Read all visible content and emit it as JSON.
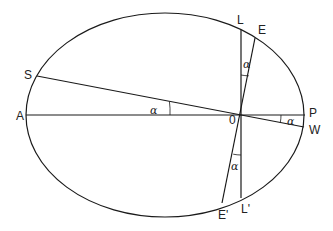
{
  "diagram": {
    "type": "ellipse-orbit-geometry",
    "ellipse": {
      "cx": 165,
      "cy": 115,
      "rx": 139,
      "ry": 102
    },
    "focus": {
      "label": "0",
      "x": 241,
      "y": 115
    },
    "points": {
      "A": {
        "label": "A",
        "x": 26,
        "y": 115
      },
      "P": {
        "label": "P",
        "x": 305,
        "y": 115
      },
      "L": {
        "label": "L",
        "x": 241,
        "y": 30
      },
      "L_prime": {
        "label": "L'",
        "x": 241,
        "y": 198
      },
      "E": {
        "label": "E",
        "x": 255,
        "y": 38
      },
      "E_prime": {
        "label": "E'",
        "x": 222,
        "y": 203
      },
      "S": {
        "label": "S",
        "x": 37,
        "y": 76
      },
      "W": {
        "label": "W",
        "x": 304,
        "y": 127
      }
    },
    "segments": [
      {
        "from": "A",
        "to": "P",
        "name": "major-axis"
      },
      {
        "from": "L",
        "to": "L_prime",
        "name": "latus-rectum"
      },
      {
        "from": "E",
        "to": "E_prime",
        "name": "line-EE'"
      },
      {
        "from": "S",
        "to": "W",
        "name": "line-SW"
      }
    ],
    "angle_labels": [
      {
        "text": "α",
        "at": "angle SOA"
      },
      {
        "text": "α",
        "at": "angle LOE"
      },
      {
        "text": "α",
        "at": "angle POW"
      },
      {
        "text": "α",
        "at": "angle L'OE'"
      }
    ]
  }
}
